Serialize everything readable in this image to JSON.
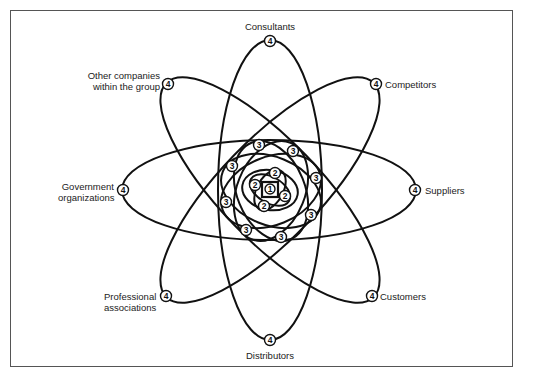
{
  "diagram": {
    "type": "atom-style network of stakeholder rings",
    "center_level": "1",
    "levels": {
      "level_1": [
        "1"
      ],
      "level_2": [
        "2",
        "2",
        "2",
        "2"
      ],
      "level_3": [
        "3",
        "3",
        "3",
        "3",
        "3",
        "3",
        "3",
        "3"
      ],
      "level_4": [
        "4",
        "4",
        "4",
        "4",
        "4",
        "4",
        "4",
        "4"
      ]
    },
    "outer_nodes": [
      {
        "id": "consultants",
        "label": "Consultants",
        "marker": "4"
      },
      {
        "id": "competitors",
        "label": "Competitors",
        "marker": "4"
      },
      {
        "id": "suppliers",
        "label": "Suppliers",
        "marker": "4"
      },
      {
        "id": "customers",
        "label": "Customers",
        "marker": "4"
      },
      {
        "id": "distributors",
        "label": "Distributors",
        "marker": "4"
      },
      {
        "id": "professional",
        "label_line1": "Professional",
        "label_line2": "associations",
        "marker": "4"
      },
      {
        "id": "government",
        "label_line1": "Government",
        "label_line2": "organizations",
        "marker": "4"
      },
      {
        "id": "other-companies",
        "label_line1": "Other companies",
        "label_line2": "within the group",
        "marker": "4"
      }
    ],
    "colors": {
      "line": "#111111",
      "background": "#ffffff",
      "frame": "#555555",
      "text": "#222222"
    }
  }
}
